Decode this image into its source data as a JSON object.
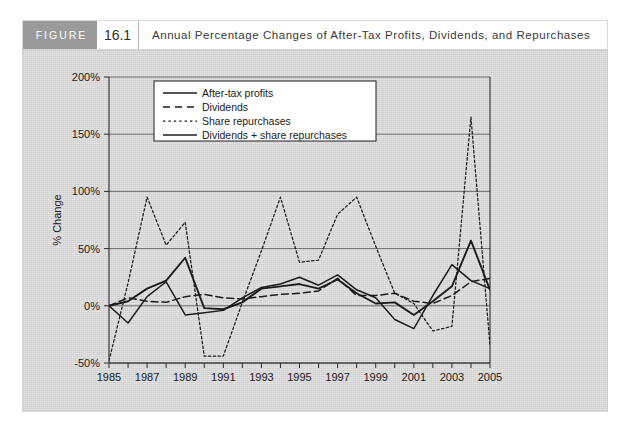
{
  "header": {
    "badge_label": "FIGURE",
    "figure_number": "16.1",
    "title": "Annual Percentage Changes of After-Tax Profits, Dividends, and Repurchases"
  },
  "colors": {
    "panel_background": "#d4d4d4",
    "badge_background": "#9a9a9a",
    "line": "#1c1c1c",
    "grid": "#5e5e5e",
    "header_background": "#ffffff"
  },
  "chart_data": {
    "type": "line",
    "title": "Annual Percentage Changes of After-Tax Profits, Dividends, and Repurchases",
    "xlabel": "",
    "ylabel": "% Change",
    "xlim": [
      1985,
      2005
    ],
    "ylim": [
      -50,
      200
    ],
    "yticks": [
      -50,
      0,
      50,
      100,
      150,
      200
    ],
    "ytick_labels": [
      "-50%",
      "0%",
      "50%",
      "100%",
      "150%",
      "200%"
    ],
    "xticks": [
      1985,
      1986,
      1987,
      1988,
      1989,
      1990,
      1991,
      1992,
      1993,
      1994,
      1995,
      1996,
      1997,
      1998,
      1999,
      2000,
      2001,
      2002,
      2003,
      2004,
      2005
    ],
    "xtick_labels": [
      "1985",
      "",
      "1987",
      "",
      "1989",
      "",
      "1991",
      "",
      "1993",
      "",
      "1995",
      "",
      "1997",
      "",
      "1999",
      "",
      "2001",
      "",
      "2003",
      "",
      "2005"
    ],
    "grid": true,
    "legend_position": "upper-left",
    "x": [
      1985,
      1986,
      1987,
      1988,
      1989,
      1990,
      1991,
      1992,
      1993,
      1994,
      1995,
      1996,
      1997,
      1998,
      1999,
      2000,
      2001,
      2002,
      2003,
      2004,
      2005
    ],
    "series": [
      {
        "name": "After-tax profits",
        "style": "solid",
        "values": [
          0,
          -15,
          8,
          21,
          -8,
          -6,
          -4,
          7,
          16,
          19,
          25,
          18,
          27,
          14,
          7,
          -12,
          -20,
          9,
          36,
          22,
          15
        ]
      },
      {
        "name": "Dividends",
        "style": "dashed",
        "values": [
          0,
          7,
          4,
          3,
          8,
          10,
          7,
          6,
          8,
          10,
          11,
          13,
          24,
          9,
          9,
          11,
          4,
          2,
          9,
          21,
          24
        ]
      },
      {
        "name": "Share repurchases",
        "style": "dotted",
        "values": [
          -48,
          20,
          95,
          53,
          73,
          -44,
          -44,
          3,
          48,
          95,
          38,
          40,
          80,
          95,
          52,
          11,
          2,
          -22,
          -18,
          165,
          -35
        ]
      },
      {
        "name": "Dividends + share repurchases",
        "style": "solid",
        "values": [
          0,
          4,
          15,
          22,
          42,
          -2,
          -3,
          3,
          15,
          17,
          19,
          15,
          23,
          11,
          2,
          3,
          -8,
          4,
          17,
          57,
          14
        ]
      }
    ]
  },
  "legend": {
    "items": [
      {
        "label": "After-tax profits",
        "style": "solid"
      },
      {
        "label": "Dividends",
        "style": "dashed"
      },
      {
        "label": "Share repurchases",
        "style": "dotted"
      },
      {
        "label": "Dividends + share repurchases",
        "style": "solid"
      }
    ]
  }
}
